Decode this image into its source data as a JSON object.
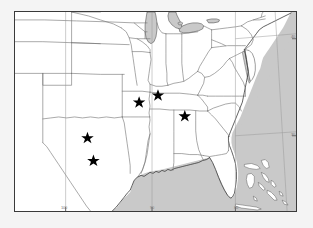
{
  "figure": {
    "kind": "map",
    "title": "",
    "background_color": "#f2f2f2",
    "frame_color": "#3a3a3a",
    "land_color": "#ffffff",
    "water_color": "#c9c9c9",
    "coast_line_color": "#3a3a3a",
    "state_line_color": "#6f6f6f",
    "grid_line_color": "#999999",
    "marker_color": "#000000",
    "region_description": "Central and southeastern United States with Gulf of Mexico, Atlantic coast, Great Lakes and Bahamas"
  },
  "graticule": {
    "longitude_labels": [
      "100",
      "90",
      "80"
    ],
    "latitude_labels": [
      "40",
      "30"
    ],
    "bottom_ticks": [
      {
        "label": "100",
        "x_pct": 18.0
      },
      {
        "label": "90",
        "x_pct": 48.7
      },
      {
        "label": "80",
        "x_pct": 78.5
      }
    ],
    "right_ticks": [
      {
        "label": "40",
        "y_pct": 13.5
      },
      {
        "label": "30",
        "y_pct": 62.0
      }
    ]
  },
  "markers": {
    "symbol": "star",
    "count": 5,
    "items": [
      {
        "name": "marker-texas-north",
        "x_pct": 25.8,
        "y_pct": 62.7
      },
      {
        "name": "marker-texas-south",
        "x_pct": 27.9,
        "y_pct": 74.1
      },
      {
        "name": "marker-missouri-bootheel",
        "x_pct": 44.2,
        "y_pct": 45.8
      },
      {
        "name": "marker-tennessee",
        "x_pct": 50.9,
        "y_pct": 42.3
      },
      {
        "name": "marker-georgia",
        "x_pct": 60.4,
        "y_pct": 52.8
      }
    ]
  },
  "water_bodies": [
    {
      "name": "gulf-of-mexico"
    },
    {
      "name": "atlantic-ocean"
    },
    {
      "name": "lake-michigan"
    },
    {
      "name": "lake-erie"
    },
    {
      "name": "lake-huron"
    },
    {
      "name": "chesapeake-bay"
    }
  ],
  "landforms": [
    {
      "name": "florida-peninsula"
    },
    {
      "name": "delmarva-peninsula"
    },
    {
      "name": "bahamas-islands"
    },
    {
      "name": "cuba"
    }
  ]
}
